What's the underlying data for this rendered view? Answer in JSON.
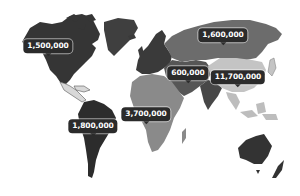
{
  "map": {
    "type": "world-choropleth",
    "colors": {
      "background": "#ffffff",
      "north_america": "#353535",
      "greenland": "#3f3f3f",
      "central_america": "#d8d8d8",
      "south_america": "#2c2c2c",
      "europe": "#3a3a3a",
      "africa": "#8a8a8a",
      "russia": "#6c6c6c",
      "middle_east_central_asia": "#565656",
      "india": "#474747",
      "china": "#c4c4c4",
      "southeast_asia": "#bdbdbd",
      "australia": "#333333",
      "callout_bg": "#2b2b2b",
      "callout_text": "#ffffff"
    },
    "callouts": [
      {
        "region": "North America",
        "value": "1,500,000",
        "x": 48,
        "y": 46
      },
      {
        "region": "South America",
        "value": "1,800,000",
        "x": 93,
        "y": 126
      },
      {
        "region": "Africa",
        "value": "3,700,000",
        "x": 146,
        "y": 114
      },
      {
        "region": "Russia",
        "value": "1,600,000",
        "x": 223,
        "y": 35
      },
      {
        "region": "Middle East / Central Asia",
        "value": "600,000",
        "x": 188,
        "y": 73
      },
      {
        "region": "China",
        "value": "11,700,000",
        "x": 238,
        "y": 77
      }
    ]
  }
}
